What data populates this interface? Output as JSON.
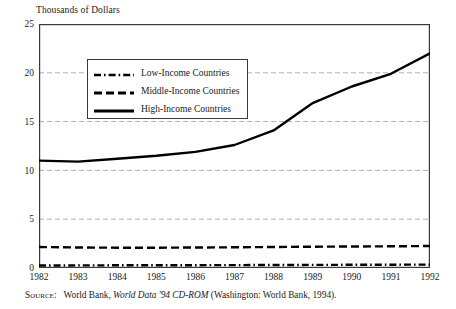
{
  "chart_data": {
    "type": "line",
    "title": "Thousands of Dollars",
    "xlabel": "",
    "ylabel": "Thousands of Dollars",
    "x": [
      1982,
      1983,
      1984,
      1985,
      1986,
      1987,
      1988,
      1989,
      1990,
      1991,
      1992
    ],
    "categories": [
      "1982",
      "1983",
      "1984",
      "1985",
      "1986",
      "1987",
      "1988",
      "1989",
      "1990",
      "1991",
      "1992"
    ],
    "xlim": [
      1982,
      1992
    ],
    "ylim": [
      0,
      25
    ],
    "yticks": [
      0,
      5,
      10,
      15,
      20,
      25
    ],
    "ytick_labels": [
      "0",
      "5",
      "10",
      "15",
      "20",
      "25"
    ],
    "grid": "horizontal-dashed",
    "legend_position": "upper-left-inside",
    "series": [
      {
        "name": "Low-Income Countries",
        "style": "dash-dot",
        "color": "#000000",
        "values": [
          0.26,
          0.27,
          0.28,
          0.29,
          0.29,
          0.3,
          0.31,
          0.32,
          0.33,
          0.34,
          0.35
        ]
      },
      {
        "name": "Middle-Income Countries",
        "style": "dashed",
        "color": "#000000",
        "values": [
          2.15,
          2.1,
          2.08,
          2.08,
          2.1,
          2.12,
          2.15,
          2.18,
          2.2,
          2.22,
          2.25
        ]
      },
      {
        "name": "High-Income Countries",
        "style": "solid",
        "color": "#000000",
        "values": [
          11.0,
          10.9,
          11.2,
          11.5,
          11.9,
          12.6,
          14.1,
          16.9,
          18.6,
          19.9,
          22.0
        ]
      }
    ]
  },
  "legend": {
    "items": [
      {
        "label": "Low-Income Countries",
        "style": "dash-dot"
      },
      {
        "label": "Middle-Income Countries",
        "style": "dashed"
      },
      {
        "label": "High-Income Countries",
        "style": "solid"
      }
    ]
  },
  "source": {
    "label": "Source:",
    "publisher": "World Bank,",
    "title_italic": "World Data '94 CD-ROM",
    "detail": "(Washington: World Bank, 1994)."
  },
  "colors": {
    "ink": "#1a1a1a",
    "line": "#000000",
    "grid": "#9a9a9a",
    "frame": "#3a3a3a",
    "background": "#ffffff"
  }
}
